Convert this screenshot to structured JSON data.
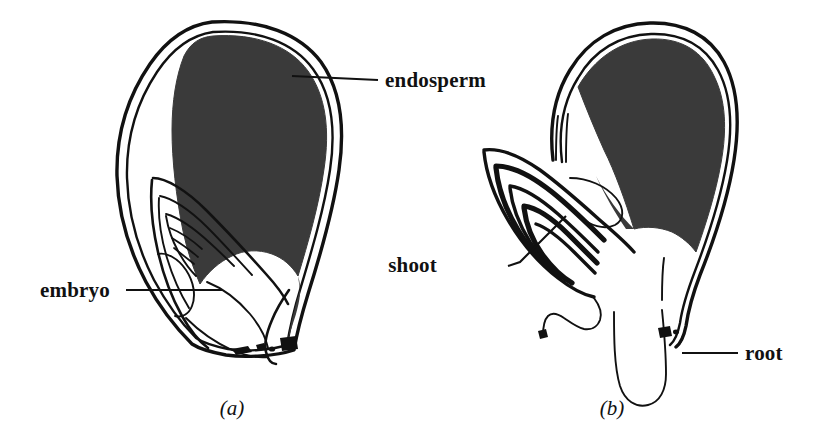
{
  "figure": {
    "background_color": "#ffffff",
    "ink_color": "#111111",
    "endosperm_fill": "#3a3a3a",
    "width": 824,
    "height": 440
  },
  "panels": [
    {
      "id": "a",
      "caption": "(a)",
      "caption_x": 232,
      "caption_y": 415,
      "description": "ungerminated seed in longitudinal section"
    },
    {
      "id": "b",
      "caption": "(b)",
      "caption_x": 612,
      "caption_y": 415,
      "description": "germinating seed with emerging shoot and root"
    }
  ],
  "labels": [
    {
      "name": "endosperm",
      "text": "endosperm",
      "text_x": 385,
      "text_y": 87,
      "leader": "M292,76 L378,80",
      "panel": "a"
    },
    {
      "name": "embryo",
      "text": "embryo",
      "text_x": 40,
      "text_y": 297,
      "leader": "M126,290 L222,290",
      "panel": "a"
    },
    {
      "name": "shoot",
      "text": "shoot",
      "text_x": 437,
      "text_y": 272,
      "leader": "M508,266 L520,262 L566,216",
      "panel": "b"
    },
    {
      "name": "root",
      "text": "root",
      "text_x": 745,
      "text_y": 360,
      "leader": "M682,353 L738,353",
      "panel": "b"
    }
  ],
  "parts": {
    "seed_coat": "seed-coat",
    "endosperm": "endosperm-region",
    "embryo": "embryo-region",
    "shoot": "shoot-region",
    "root": "root-region",
    "hilum": "hilum-scar"
  },
  "icons": {
    "endosperm_leader": "leader-line-icon",
    "embryo_leader": "leader-line-icon",
    "shoot_leader": "leader-line-icon",
    "root_leader": "leader-line-icon"
  }
}
